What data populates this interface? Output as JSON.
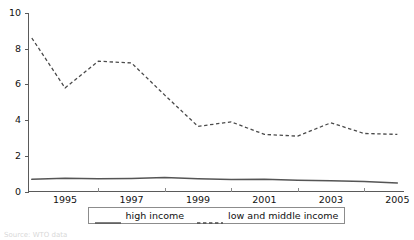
{
  "chart_data": {
    "type": "line",
    "title": "",
    "subtitle": "",
    "xlabel": "",
    "ylabel": "",
    "xlim": [
      1994.3,
      2005.6
    ],
    "ylim": [
      0,
      10
    ],
    "grid": false,
    "legend_position": "bottom-center",
    "y_ticks": [
      0,
      2,
      4,
      6,
      8,
      10
    ],
    "y_tick_labels": [
      "0",
      "2",
      "4",
      "6",
      "8",
      "10"
    ],
    "x_tick_labels": [
      "1995",
      "1997",
      "1999",
      "2001",
      "2003",
      "2005"
    ],
    "x_tick_values": [
      1995,
      1997,
      1999,
      2001,
      2003,
      2005
    ],
    "x": [
      1994.4,
      1995.4,
      1996.4,
      1997.4,
      1998.4,
      1999.4,
      2000.4,
      2001.4,
      2002.4,
      2003.4,
      2004.4,
      2005.4
    ],
    "series": [
      {
        "name": "high income",
        "style": "solid",
        "color": "#555555",
        "values": [
          0.68,
          0.74,
          0.72,
          0.73,
          0.78,
          0.72,
          0.67,
          0.68,
          0.63,
          0.6,
          0.56,
          0.48
        ]
      },
      {
        "name": "low and middle income",
        "style": "dashed",
        "color": "#4a4a4a",
        "values": [
          8.6,
          5.8,
          7.3,
          7.2,
          5.4,
          3.65,
          3.9,
          3.2,
          3.1,
          3.85,
          3.25,
          3.2
        ]
      }
    ]
  },
  "legend": {
    "entries": [
      {
        "label": "high income",
        "style": "solid"
      },
      {
        "label": "low and middle income",
        "style": "dashed"
      }
    ]
  },
  "source_note": "Source: WTO data"
}
